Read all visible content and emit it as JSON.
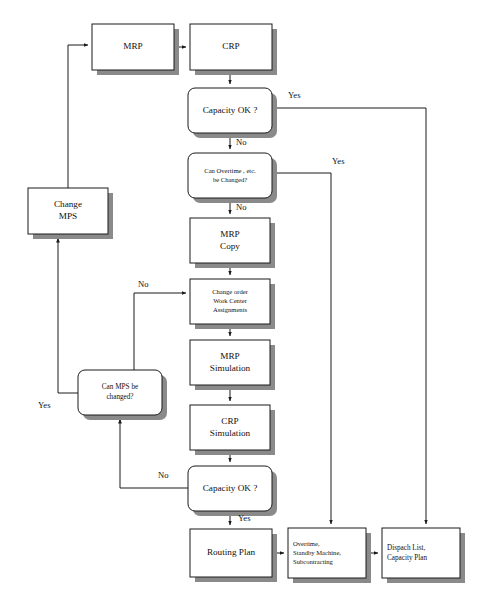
{
  "figure": {
    "caption": "",
    "background_color": "#ffffff",
    "line_color": "#1a1a1a",
    "shadow_color": "#8a8a8a"
  },
  "nodes": [
    {
      "id": "mrp",
      "shape": "rect",
      "x": 92,
      "y": 24,
      "w": 82,
      "h": 46,
      "lines": [
        "MRP"
      ],
      "size": "normal"
    },
    {
      "id": "crp",
      "shape": "rect",
      "x": 190,
      "y": 24,
      "w": 82,
      "h": 46,
      "lines": [
        "CRP"
      ],
      "size": "normal"
    },
    {
      "id": "cap_ok_1",
      "shape": "round",
      "x": 188,
      "y": 88,
      "w": 84,
      "h": 45,
      "lines": [
        "Capacity OK ?"
      ],
      "size": "normal"
    },
    {
      "id": "can_overtime",
      "shape": "round",
      "x": 188,
      "y": 153,
      "w": 84,
      "h": 45,
      "lines": [
        "Can Overtime , etc.",
        "be Changed?"
      ],
      "size": "tiny"
    },
    {
      "id": "mrp_copy",
      "shape": "rect",
      "x": 190,
      "y": 218,
      "w": 80,
      "h": 45,
      "lines": [
        "MRP",
        "Copy"
      ],
      "size": "normal"
    },
    {
      "id": "change_order",
      "shape": "rect",
      "x": 190,
      "y": 279,
      "w": 80,
      "h": 45,
      "lines": [
        "Change order",
        "Work Center",
        "Assignments"
      ],
      "size": "tiny"
    },
    {
      "id": "mrp_sim",
      "shape": "rect",
      "x": 190,
      "y": 340,
      "w": 80,
      "h": 45,
      "lines": [
        "MRP",
        "Simulation"
      ],
      "size": "normal"
    },
    {
      "id": "crp_sim",
      "shape": "rect",
      "x": 190,
      "y": 405,
      "w": 80,
      "h": 45,
      "lines": [
        "CRP",
        "Simulation"
      ],
      "size": "normal"
    },
    {
      "id": "cap_ok_2",
      "shape": "round",
      "x": 188,
      "y": 466,
      "w": 84,
      "h": 45,
      "lines": [
        "Capacity OK ?"
      ],
      "size": "normal"
    },
    {
      "id": "change_mps",
      "shape": "rect",
      "x": 28,
      "y": 188,
      "w": 80,
      "h": 46,
      "lines": [
        "Change",
        "MPS"
      ],
      "size": "normal"
    },
    {
      "id": "can_mps",
      "shape": "round",
      "x": 78,
      "y": 370,
      "w": 84,
      "h": 45,
      "lines": [
        "Can MPS be",
        "changed?"
      ],
      "size": "small"
    },
    {
      "id": "routing_plan",
      "shape": "rect",
      "x": 190,
      "y": 529,
      "w": 82,
      "h": 48,
      "lines": [
        "Routing Plan"
      ],
      "size": "normal"
    },
    {
      "id": "overtime_box",
      "shape": "rect",
      "x": 288,
      "y": 528,
      "w": 78,
      "h": 50,
      "lines": [
        "Overtime,",
        "Standby Machine,",
        "Subcontracting"
      ],
      "size": "tiny",
      "align": "left"
    },
    {
      "id": "dispatch_box",
      "shape": "rect",
      "x": 382,
      "y": 528,
      "w": 78,
      "h": 50,
      "lines": [
        "Dispach List,",
        "Capacity Plan"
      ],
      "size": "small",
      "align": "left"
    }
  ],
  "edge_labels": [
    {
      "id": "yes-cap1",
      "text": "Yes",
      "x": 288,
      "y": 96
    },
    {
      "id": "no-cap1",
      "text": "No",
      "x": 236,
      "y": 143
    },
    {
      "id": "yes-overtime",
      "text": "Yes",
      "x": 332,
      "y": 162
    },
    {
      "id": "no-overtime",
      "text": "No",
      "x": 236,
      "y": 208
    },
    {
      "id": "no-changeord",
      "text": "No",
      "x": 138,
      "y": 285
    },
    {
      "id": "yes-canmps",
      "text": "Yes",
      "x": 38,
      "y": 406
    },
    {
      "id": "no-cap2",
      "text": "No",
      "x": 158,
      "y": 476
    },
    {
      "id": "yes-cap2",
      "text": "Yes",
      "x": 238,
      "y": 519
    }
  ],
  "edges": [
    {
      "id": "mrp-to-crp",
      "from": "mrp",
      "to": "crp"
    },
    {
      "id": "crp-to-cap1",
      "from": "crp",
      "to": "cap_ok_1"
    },
    {
      "id": "cap1-yes-to-dispatch",
      "from": "cap_ok_1",
      "to": "dispatch_box",
      "label": "Yes"
    },
    {
      "id": "cap1-no-to-overtime-q",
      "from": "cap_ok_1",
      "to": "can_overtime",
      "label": "No"
    },
    {
      "id": "overtime-yes-to-box",
      "from": "can_overtime",
      "to": "overtime_box",
      "label": "Yes"
    },
    {
      "id": "overtime-no-to-copy",
      "from": "can_overtime",
      "to": "mrp_copy",
      "label": "No"
    },
    {
      "id": "copy-to-changeorder",
      "from": "mrp_copy",
      "to": "change_order"
    },
    {
      "id": "changeorder-to-mrpsim",
      "from": "change_order",
      "to": "mrp_sim"
    },
    {
      "id": "mrpsim-to-crpsim",
      "from": "mrp_sim",
      "to": "crp_sim"
    },
    {
      "id": "crpsim-to-cap2",
      "from": "crp_sim",
      "to": "cap_ok_2"
    },
    {
      "id": "cap2-no-to-canmps",
      "from": "cap_ok_2",
      "to": "can_mps",
      "label": "No"
    },
    {
      "id": "canmps-no-to-changeord",
      "from": "can_mps",
      "to": "change_order",
      "label": "No"
    },
    {
      "id": "canmps-yes-to-mps",
      "from": "can_mps",
      "to": "change_mps",
      "label": "Yes"
    },
    {
      "id": "changemps-to-mrp",
      "from": "change_mps",
      "to": "mrp"
    },
    {
      "id": "cap2-yes-to-routing",
      "from": "cap_ok_2",
      "to": "routing_plan",
      "label": "Yes"
    },
    {
      "id": "routing-to-overtime",
      "from": "routing_plan",
      "to": "overtime_box"
    },
    {
      "id": "overtime-to-dispatch",
      "from": "overtime_box",
      "to": "dispatch_box"
    }
  ]
}
